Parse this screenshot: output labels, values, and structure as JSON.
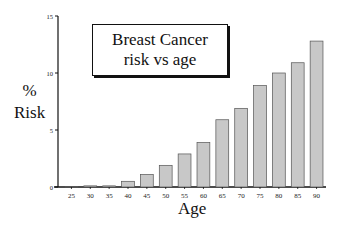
{
  "chart_data": {
    "type": "bar",
    "title": "Breast Cancer risk vs age",
    "title_lines": [
      "Breast Cancer",
      "risk vs age"
    ],
    "xlabel": "Age",
    "ylabel": "% Risk",
    "ylabel_lines": [
      "%",
      "Risk"
    ],
    "categories": [
      "25",
      "30",
      "35",
      "40",
      "45",
      "50",
      "55",
      "60",
      "65",
      "70",
      "75",
      "80",
      "85",
      "90"
    ],
    "values": [
      0.05,
      0.1,
      0.1,
      0.5,
      1.1,
      1.9,
      2.9,
      3.9,
      5.9,
      6.9,
      8.9,
      10,
      10.9,
      12.8
    ],
    "ylim": [
      0,
      15
    ],
    "yticks": [
      0,
      5,
      10,
      15
    ],
    "grid": false,
    "legend": null,
    "colors": {
      "bar_fill": "#c8c8c8",
      "bar_stroke": "#555555",
      "axis": "#111111"
    }
  }
}
